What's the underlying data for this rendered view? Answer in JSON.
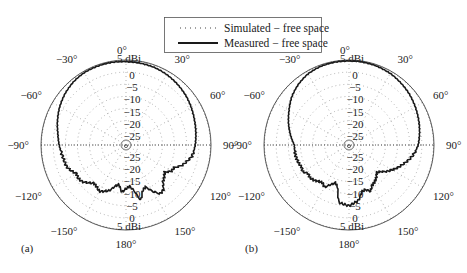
{
  "legend": {
    "items": [
      {
        "label": "Simulated − free space",
        "style": "dotted"
      },
      {
        "label": "Measured − free space",
        "style": "solid"
      }
    ]
  },
  "panels": [
    {
      "id": "a",
      "label": "(a)"
    },
    {
      "id": "b",
      "label": "(b)"
    }
  ],
  "angle_labels": [
    "0°",
    "30°",
    "60°",
    "90°",
    "120°",
    "150°",
    "180°",
    "−150°",
    "−120°",
    "−90°",
    "−60°",
    "−30°"
  ],
  "radial_labels_upper": [
    "5 dBi",
    "0",
    "−5",
    "−10",
    "−15",
    "−20",
    "−25"
  ],
  "radial_labels_lower": [
    "−25",
    "−20",
    "−15",
    "−10",
    "−5",
    "0",
    "5 dBi"
  ],
  "colors": {
    "measured": "#1a1a1a",
    "simulated": "#555555",
    "grid": "#8a8a8a",
    "outer": "#444444"
  },
  "chart_data": [
    {
      "type": "polar-line",
      "panel": "(a)",
      "title": "",
      "rlabel": "dBi",
      "rlim": [
        -30,
        5
      ],
      "r_ticks": [
        5,
        0,
        -5,
        -10,
        -15,
        -20,
        -25
      ],
      "theta_ticks_deg": [
        0,
        30,
        60,
        90,
        120,
        150,
        180,
        -150,
        -120,
        -90,
        -60,
        -30
      ],
      "theta_zero": "top",
      "theta_direction": "clockwise",
      "grid": "dotted",
      "legend_position": "top-center",
      "series": [
        {
          "name": "Measured − free space",
          "style": "solid",
          "theta_deg": [
            0,
            10,
            20,
            30,
            40,
            50,
            60,
            70,
            80,
            90,
            100,
            110,
            115,
            120,
            125,
            130,
            135,
            140,
            145,
            150,
            155,
            160,
            165,
            170,
            175,
            180,
            -175,
            -170,
            -165,
            -160,
            -155,
            -150,
            -145,
            -140,
            -135,
            -130,
            -125,
            -120,
            -115,
            -110,
            -100,
            -90,
            -80,
            -70,
            -60,
            -50,
            -40,
            -30,
            -20,
            -10
          ],
          "values_dBi": [
            4.3,
            4.2,
            4.0,
            3.5,
            2.8,
            2.0,
            1.0,
            0.0,
            -0.8,
            -1.5,
            -2.5,
            -5.5,
            -8.0,
            -8.5,
            -10.5,
            -9.5,
            -8.5,
            -6.0,
            -5.5,
            -8.0,
            -11.0,
            -10.0,
            -6.5,
            -11.0,
            -13.0,
            -12.0,
            -10.5,
            -13.5,
            -12.5,
            -10.0,
            -9.0,
            -8.0,
            -9.0,
            -9.5,
            -8.0,
            -6.5,
            -6.0,
            -6.5,
            -5.0,
            -4.0,
            -3.5,
            -2.5,
            -1.5,
            0.0,
            1.5,
            2.8,
            3.8,
            4.4,
            4.5,
            4.5
          ]
        },
        {
          "name": "Simulated − free space",
          "style": "dotted",
          "theta_deg": [
            0,
            30,
            60,
            90,
            120,
            150,
            180,
            -150,
            -120,
            -90,
            -60,
            -30
          ],
          "values_dBi": [
            5.0,
            5.0,
            5.0,
            5.0,
            5.0,
            5.0,
            5.0,
            5.0,
            5.0,
            5.0,
            5.0,
            5.0
          ],
          "note": "simulated trace not distinguishable from outer ring at this resolution"
        }
      ]
    },
    {
      "type": "polar-line",
      "panel": "(b)",
      "title": "",
      "rlabel": "dBi",
      "rlim": [
        -30,
        5
      ],
      "r_ticks": [
        5,
        0,
        -5,
        -10,
        -15,
        -20,
        -25
      ],
      "theta_ticks_deg": [
        0,
        30,
        60,
        90,
        120,
        150,
        180,
        -150,
        -120,
        -90,
        -60,
        -30
      ],
      "theta_zero": "top",
      "theta_direction": "clockwise",
      "grid": "dotted",
      "series": [
        {
          "name": "Measured − free space",
          "style": "solid",
          "theta_deg": [
            0,
            10,
            20,
            30,
            40,
            50,
            60,
            70,
            80,
            90,
            100,
            110,
            115,
            120,
            125,
            130,
            135,
            140,
            145,
            150,
            155,
            160,
            165,
            170,
            175,
            180,
            -175,
            -170,
            -165,
            -160,
            -155,
            -150,
            -145,
            -140,
            -135,
            -130,
            -125,
            -120,
            -115,
            -110,
            -100,
            -90,
            -80,
            -70,
            -60,
            -50,
            -40,
            -30,
            -20,
            -10
          ],
          "values_dBi": [
            4.6,
            4.6,
            4.4,
            4.0,
            3.3,
            2.5,
            1.5,
            0.5,
            -0.5,
            -1.5,
            -3.5,
            -6.5,
            -8.0,
            -9.5,
            -11.0,
            -13.0,
            -14.0,
            -12.5,
            -11.5,
            -11.0,
            -9.0,
            -10.5,
            -10.0,
            -7.0,
            -6.0,
            -5.0,
            -5.5,
            -6.0,
            -12.0,
            -13.5,
            -12.0,
            -10.0,
            -11.0,
            -10.5,
            -9.5,
            -9.0,
            -9.5,
            -8.0,
            -8.5,
            -8.0,
            -7.5,
            -7.5,
            -5.5,
            -3.5,
            -1.5,
            0.8,
            2.5,
            3.8,
            4.4,
            4.6
          ]
        },
        {
          "name": "Simulated − free space",
          "style": "dotted",
          "theta_deg": [
            0,
            30,
            60,
            90,
            120,
            150,
            180,
            -150,
            -120,
            -90,
            -60,
            -30
          ],
          "values_dBi": [
            5.0,
            5.0,
            5.0,
            5.0,
            5.0,
            5.0,
            5.0,
            5.0,
            5.0,
            5.0,
            5.0,
            5.0
          ],
          "note": "simulated trace not distinguishable from outer ring at this resolution"
        }
      ]
    }
  ]
}
